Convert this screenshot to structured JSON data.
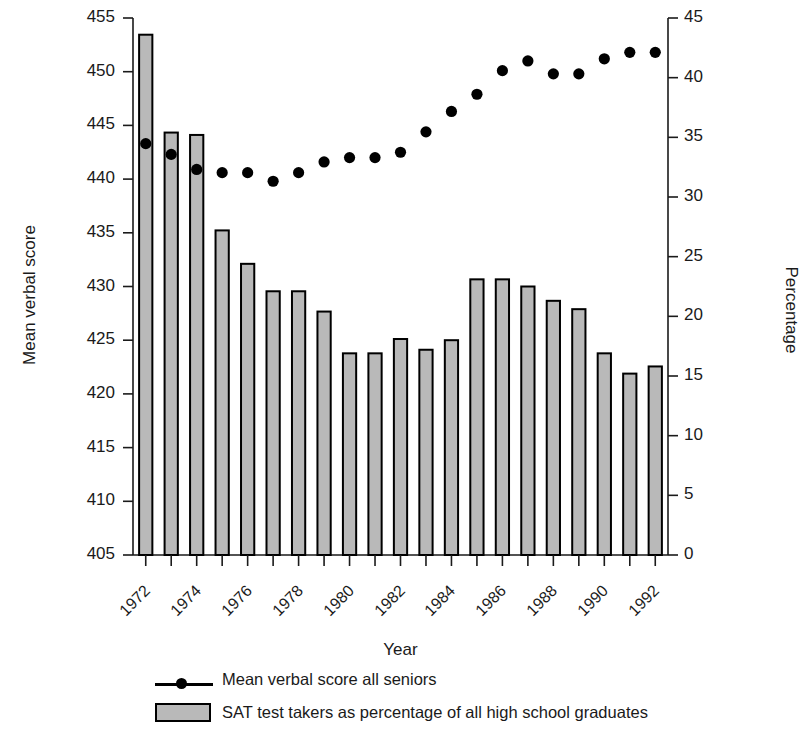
{
  "chart_data": {
    "type": "bar",
    "title": "",
    "xlabel": "Year",
    "ylabel": "Mean verbal score",
    "ylabel_right": "Percentage",
    "grid": false,
    "legend_position": "bottom",
    "ylim": [
      405,
      455
    ],
    "ylim_right": [
      0,
      45
    ],
    "yticks": [
      405,
      410,
      415,
      420,
      425,
      430,
      435,
      440,
      445,
      450,
      455
    ],
    "yticks_right": [
      0,
      5,
      10,
      15,
      20,
      25,
      30,
      35,
      40,
      45
    ],
    "categories": [
      1972,
      1973,
      1974,
      1975,
      1976,
      1977,
      1978,
      1979,
      1980,
      1981,
      1982,
      1983,
      1984,
      1985,
      1986,
      1987,
      1988,
      1989,
      1990,
      1991,
      1992
    ],
    "xtick_labels": [
      "1972",
      "1974",
      "1976",
      "1978",
      "1980",
      "1982",
      "1984",
      "1986",
      "1988",
      "1990",
      "1992"
    ],
    "xtick_years": [
      1972,
      1974,
      1976,
      1978,
      1980,
      1982,
      1984,
      1986,
      1988,
      1990,
      1992
    ],
    "series": [
      {
        "name": "SAT test takers as percentage of all high school graduates",
        "type": "bar",
        "axis": "right",
        "unit": "percent",
        "color": "#b9b9b9",
        "edge_color": "#000000",
        "values": [
          43.6,
          35.4,
          35.2,
          27.2,
          24.4,
          22.1,
          22.1,
          20.4,
          16.9,
          16.9,
          18.1,
          17.2,
          18.0,
          23.1,
          23.1,
          22.5,
          21.3,
          20.6,
          16.9,
          15.2,
          15.8
        ]
      },
      {
        "name": "Mean verbal score all seniors",
        "type": "line",
        "marker": "circle",
        "axis": "left",
        "unit": "score",
        "color": "#000000",
        "values": [
          443.3,
          442.3,
          440.9,
          440.6,
          440.6,
          439.8,
          440.6,
          441.6,
          442.0,
          442.0,
          442.5,
          444.4,
          446.3,
          447.9,
          450.1,
          451.0,
          449.8,
          449.8,
          451.2,
          451.8,
          451.8
        ]
      }
    ],
    "legend": [
      {
        "label": "Mean verbal score all seniors",
        "marker": "line-dot",
        "color": "#000000"
      },
      {
        "label": "SAT test takers as percentage of all high school graduates",
        "marker": "swatch",
        "color": "#b9b9b9"
      }
    ]
  },
  "axes": {
    "left_title": "Mean verbal score",
    "right_title": "Percentage",
    "x_title": "Year"
  },
  "legend": {
    "line_label": "Mean verbal score all seniors",
    "bar_label": "SAT test takers as percentage of all high school graduates"
  }
}
